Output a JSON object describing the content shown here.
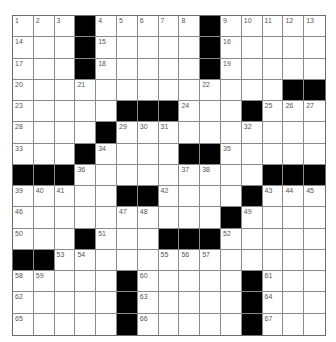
{
  "puzzle": {
    "type": "crossword",
    "size": {
      "rows": 15,
      "cols": 15
    },
    "colors": {
      "block": "#000000",
      "cell": "#ffffff",
      "grid_line": "#8a8a8a",
      "number": "#555555"
    },
    "legend": {
      "#": "black-square",
      ".": "empty-white-square",
      "number": "numbered-white-square"
    },
    "grid": [
      [
        "1",
        "2",
        "3",
        "#",
        "4",
        "5",
        "6",
        "7",
        "8",
        "#",
        "9",
        "10",
        "11",
        "12",
        "13"
      ],
      [
        "14",
        ".",
        ".",
        "#",
        "15",
        ".",
        ".",
        ".",
        ".",
        "#",
        "16",
        ".",
        ".",
        ".",
        "."
      ],
      [
        "17",
        ".",
        ".",
        "#",
        "18",
        ".",
        ".",
        ".",
        ".",
        "#",
        "19",
        ".",
        ".",
        ".",
        "."
      ],
      [
        "20",
        ".",
        ".",
        "21",
        ".",
        ".",
        ".",
        ".",
        ".",
        "22",
        ".",
        ".",
        ".",
        "#",
        "#"
      ],
      [
        "23",
        ".",
        ".",
        ".",
        ".",
        "#",
        "#",
        "#",
        "24",
        ".",
        ".",
        "#",
        "25",
        "26",
        "27"
      ],
      [
        "28",
        ".",
        ".",
        ".",
        "#",
        "29",
        "30",
        "31",
        ".",
        ".",
        ".",
        "32",
        ".",
        ".",
        "."
      ],
      [
        "33",
        ".",
        ".",
        "#",
        "34",
        ".",
        ".",
        ".",
        "#",
        "#",
        "35",
        ".",
        ".",
        ".",
        "."
      ],
      [
        "#",
        "#",
        "#",
        "36",
        ".",
        ".",
        ".",
        ".",
        "37",
        "38",
        ".",
        ".",
        "#",
        "#",
        "#"
      ],
      [
        "39",
        "40",
        "41",
        ".",
        ".",
        "#",
        "#",
        "42",
        ".",
        ".",
        ".",
        "#",
        "43",
        "44",
        "45"
      ],
      [
        "46",
        ".",
        ".",
        ".",
        ".",
        "47",
        "48",
        ".",
        ".",
        ".",
        "#",
        "49",
        ".",
        ".",
        "."
      ],
      [
        "50",
        ".",
        ".",
        "#",
        "51",
        ".",
        ".",
        "#",
        "#",
        "#",
        "52",
        ".",
        ".",
        ".",
        "."
      ],
      [
        "#",
        "#",
        "53",
        "54",
        ".",
        ".",
        ".",
        "55",
        "56",
        "57",
        ".",
        ".",
        ".",
        ".",
        "."
      ],
      [
        "58",
        "59",
        ".",
        ".",
        ".",
        "#",
        "60",
        ".",
        ".",
        ".",
        ".",
        "#",
        "61",
        ".",
        "."
      ],
      [
        "62",
        ".",
        ".",
        ".",
        ".",
        "#",
        "63",
        ".",
        ".",
        ".",
        ".",
        "#",
        "64",
        ".",
        "."
      ],
      [
        "65",
        ".",
        ".",
        ".",
        ".",
        "#",
        "66",
        ".",
        ".",
        ".",
        ".",
        "#",
        "67",
        ".",
        "."
      ]
    ]
  }
}
